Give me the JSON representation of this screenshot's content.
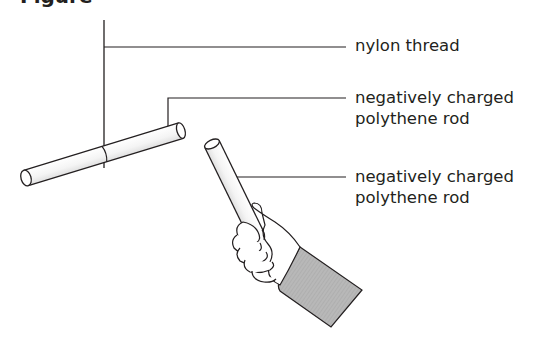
{
  "figure": {
    "heading_fragment": "Figure",
    "labels": [
      {
        "id": "thread",
        "lines": [
          "nylon thread"
        ]
      },
      {
        "id": "hanging_rod",
        "lines": [
          "negatively charged",
          "polythene rod"
        ]
      },
      {
        "id": "held_rod",
        "lines": [
          "negatively charged",
          "polythene rod"
        ]
      }
    ],
    "colors": {
      "line": "#231f20",
      "sleeve": "#b3b3b3",
      "rod_fill": "#ffffff"
    }
  }
}
